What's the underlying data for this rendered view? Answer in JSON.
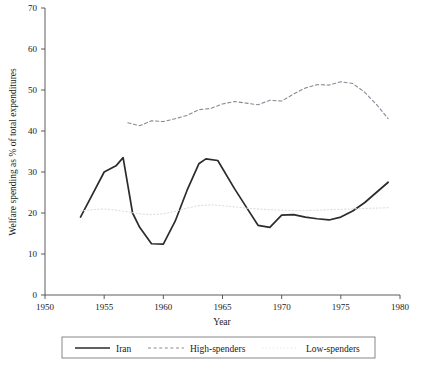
{
  "chart_data": {
    "type": "line",
    "title": "",
    "xlabel": "Year",
    "ylabel": "Welfare spending as % of total expenditures",
    "xlim": [
      1950,
      1980
    ],
    "ylim": [
      0,
      70
    ],
    "xticks": [
      1950,
      1955,
      1960,
      1965,
      1970,
      1975,
      1980
    ],
    "yticks": [
      0,
      10,
      20,
      30,
      40,
      50,
      60,
      70
    ],
    "grid": false,
    "legend_position": "bottom",
    "series": [
      {
        "name": "Iran",
        "style": "solid",
        "color": "#2b2b2b",
        "x": [
          1953,
          1954,
          1955,
          1956,
          1956.6,
          1957.4,
          1958,
          1959,
          1960,
          1961,
          1962,
          1963,
          1963.6,
          1964.6,
          1966,
          1967,
          1968,
          1969,
          1970,
          1971,
          1972,
          1973,
          1974,
          1975,
          1976,
          1977,
          1978,
          1979
        ],
        "y": [
          19.0,
          24.5,
          30.0,
          31.5,
          33.5,
          20.0,
          16.5,
          12.5,
          12.4,
          18.0,
          25.5,
          32.0,
          33.2,
          32.8,
          26.0,
          21.5,
          17.0,
          16.5,
          19.5,
          19.6,
          19.0,
          18.6,
          18.3,
          19.0,
          20.5,
          22.5,
          25.0,
          27.5
        ]
      },
      {
        "name": "High-spenders",
        "style": "dashed",
        "color": "#8a8a96",
        "x": [
          1957,
          1958,
          1959,
          1960,
          1961,
          1962,
          1963,
          1964,
          1965,
          1966,
          1967,
          1968,
          1969,
          1970,
          1971,
          1972,
          1973,
          1974,
          1975,
          1976,
          1977,
          1978,
          1979
        ],
        "y": [
          42.0,
          41.3,
          42.5,
          42.3,
          43.0,
          43.8,
          45.2,
          45.5,
          46.6,
          47.2,
          46.8,
          46.4,
          47.5,
          47.3,
          49.0,
          50.5,
          51.3,
          51.2,
          52.0,
          51.6,
          49.5,
          46.5,
          43.0
        ]
      },
      {
        "name": "Low-spenders",
        "style": "dotted",
        "color": "#dedee4",
        "x": [
          1953,
          1954,
          1955,
          1956,
          1957,
          1958,
          1959,
          1960,
          1961,
          1962,
          1963,
          1964,
          1965,
          1966,
          1967,
          1968,
          1969,
          1970,
          1971,
          1972,
          1973,
          1974,
          1975,
          1976,
          1977,
          1978,
          1979
        ],
        "y": [
          20.5,
          20.8,
          21.0,
          20.7,
          20.3,
          19.8,
          19.6,
          19.8,
          20.4,
          21.2,
          21.8,
          22.0,
          21.8,
          21.5,
          21.2,
          21.0,
          20.8,
          20.7,
          20.6,
          20.6,
          20.7,
          20.8,
          20.9,
          21.0,
          21.1,
          21.2,
          21.3
        ]
      }
    ]
  },
  "legend": {
    "items": [
      {
        "label": "Iran"
      },
      {
        "label": "High-spenders"
      },
      {
        "label": "Low-spenders"
      }
    ]
  }
}
